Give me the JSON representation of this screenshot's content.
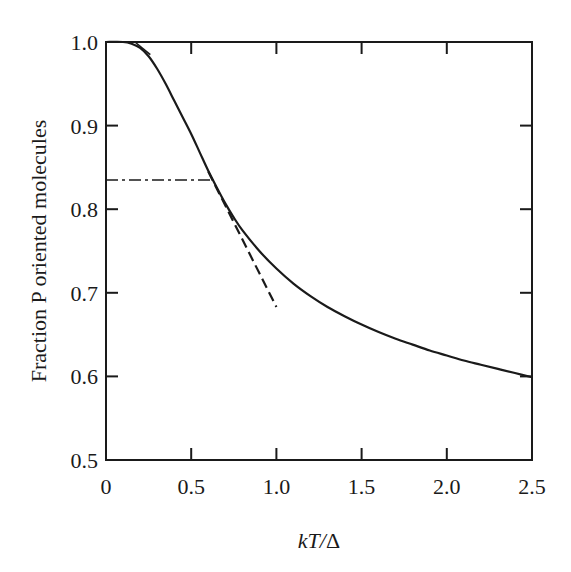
{
  "chart_data": {
    "type": "line",
    "title": "",
    "xlabel": "kT/Δ",
    "ylabel": "Fraction P oriented molecules",
    "xlim": [
      0,
      2.5
    ],
    "ylim": [
      0.5,
      1.0
    ],
    "grid": false,
    "legend": null,
    "x_ticks": [
      "0",
      "0.5",
      "1.0",
      "1.5",
      "2.0",
      "2.5"
    ],
    "y_ticks": [
      "0.5",
      "0.6",
      "0.7",
      "0.8",
      "0.9",
      "1.0"
    ],
    "series": [
      {
        "name": "P(kT/Δ)",
        "style": "solid",
        "x": [
          0.0,
          0.1,
          0.15,
          0.2,
          0.25,
          0.3,
          0.35,
          0.4,
          0.45,
          0.5,
          0.55,
          0.6,
          0.65,
          0.7,
          0.75,
          0.8,
          0.9,
          1.0,
          1.1,
          1.2,
          1.3,
          1.4,
          1.5,
          1.6,
          1.7,
          1.8,
          1.9,
          2.0,
          2.1,
          2.2,
          2.3,
          2.4,
          2.5
        ],
        "y": [
          1.0,
          1.0,
          0.998,
          0.993,
          0.983,
          0.968,
          0.95,
          0.93,
          0.91,
          0.89,
          0.868,
          0.846,
          0.826,
          0.807,
          0.79,
          0.775,
          0.75,
          0.729,
          0.711,
          0.696,
          0.683,
          0.672,
          0.662,
          0.653,
          0.645,
          0.638,
          0.631,
          0.625,
          0.619,
          0.614,
          0.609,
          0.604,
          0.599
        ]
      },
      {
        "name": "tangent at inflection",
        "style": "dashed",
        "x": [
          0.6,
          1.0
        ],
        "y": [
          0.845,
          0.683
        ]
      },
      {
        "name": "tangent near P=1",
        "style": "solid-short",
        "x": [
          0.17,
          0.26
        ],
        "y": [
          1.0,
          0.985
        ]
      },
      {
        "name": "reference level",
        "style": "dash-dot",
        "x": [
          0.0,
          0.63
        ],
        "y": [
          0.835,
          0.835
        ]
      }
    ],
    "annotations": []
  },
  "axes": {
    "x_title": "kT/Δ",
    "x_title_k": "kT",
    "x_title_slash": "/",
    "x_title_delta": "Δ",
    "y_title": "Fraction P oriented molecules",
    "x_tick_labels": [
      "0",
      "0.5",
      "1.0",
      "1.5",
      "2.0",
      "2.5"
    ],
    "y_tick_labels": [
      "0.5",
      "0.6",
      "0.7",
      "0.8",
      "0.9",
      "1.0"
    ]
  },
  "colors": {
    "ink": "#1a1a1a",
    "background": "#ffffff"
  }
}
